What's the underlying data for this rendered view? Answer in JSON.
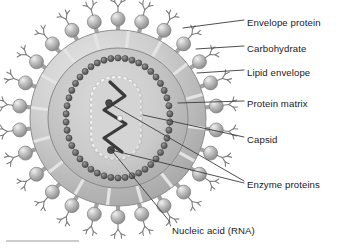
{
  "figure": {
    "top_fragment": "",
    "palette": {
      "background": "#ffffff",
      "envelope_outer": "#b9b9b9",
      "envelope_light": "#d2d2d2",
      "matrix": "#c2c2c2",
      "core_fill": "#cfcfcf",
      "capsid_bead_dark": "#5a5a5a",
      "capsid_bead_light": "#efefef",
      "rna_stroke": "#3a3a3a",
      "enzyme_dot": "#4a4a4a",
      "spike_sphere": "#b5b5b5",
      "spike_stalk": "#a8a8a8",
      "carbohydrate": "#8a8a8a",
      "leader_line": "#3b3b3b",
      "label_text": "#1a1a1a",
      "rule": "#9a9a9a"
    }
  },
  "labels": [
    {
      "id": "envelope-protein",
      "text": "Envelope protein",
      "x": 247,
      "y": 18
    },
    {
      "id": "carbohydrate",
      "text": "Carbohydrate",
      "x": 247,
      "y": 44
    },
    {
      "id": "lipid-envelope",
      "text": "Lipid envelope",
      "x": 247,
      "y": 68
    },
    {
      "id": "protein-matrix",
      "text": "Protein matrix",
      "x": 247,
      "y": 99
    },
    {
      "id": "capsid",
      "text": "Capsid",
      "x": 247,
      "y": 135
    },
    {
      "id": "enzyme-proteins",
      "text": "Enzyme proteins",
      "x": 247,
      "y": 180
    },
    {
      "id": "nucleic-acid",
      "text": "Nucleic acid (RNA)",
      "x": 172,
      "y": 226
    }
  ],
  "structures": {
    "virion_center": {
      "cx": 118,
      "cy": 118
    },
    "envelope_radius": 88,
    "matrix_radius": 70,
    "core_rx": 52,
    "core_ry": 60,
    "spike_count": 26,
    "capsid_bead_count_outer": 46,
    "capsid_bead_count_inner": 38,
    "rna_peaks": 4,
    "enzyme_dot_count": 2
  },
  "annotation_targets": {
    "envelope_protein": {
      "x": 183,
      "y": 28
    },
    "carbohydrate": {
      "x": 196,
      "y": 49
    },
    "lipid_envelope": {
      "x": 197,
      "y": 73
    },
    "protein_matrix": {
      "x": 178,
      "y": 103
    },
    "capsid": {
      "x": 143,
      "y": 115
    },
    "enzyme_dot_upper": {
      "x": 109,
      "y": 103
    },
    "enzyme_dot_lower": {
      "x": 111,
      "y": 150
    },
    "nucleic_acid": {
      "x": 113,
      "y": 152
    }
  }
}
